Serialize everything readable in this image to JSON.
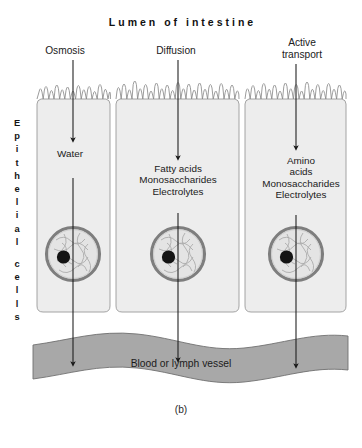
{
  "figure": {
    "title": "Lumen of intestine",
    "caption": "(b)",
    "side_label": "Epithelial cells",
    "side_label_lines": [
      "E",
      "p",
      "i",
      "t",
      "h",
      "e",
      "l",
      "i",
      "a",
      "l",
      "",
      "c",
      "e",
      "l",
      "l",
      "s"
    ],
    "vessel_label": "Blood or lymph vessel"
  },
  "transport_columns": [
    {
      "process": "Osmosis",
      "substances": "Water",
      "arrow": "down-arrow-icon"
    },
    {
      "process": "Diffusion",
      "substances": "Fatty acids\nMonosaccharides\nElectrolytes",
      "arrow": "down-arrow-icon"
    },
    {
      "process": "Active\ntransport",
      "substances": "Amino\nacids\nMonosaccharides\nElectrolytes",
      "arrow": "down-arrow-icon"
    }
  ],
  "cells": [
    {
      "name": "epithelial-cell-left",
      "nucleus": "nucleus-icon"
    },
    {
      "name": "epithelial-cell-middle",
      "nucleus": "nucleus-icon"
    },
    {
      "name": "epithelial-cell-right",
      "nucleus": "nucleus-icon"
    }
  ],
  "colors": {
    "background": "#ffffff",
    "cell_fill": "#ededed",
    "cell_outline": "#8d8d8d",
    "vessel_fill": "#a8a8a8",
    "vessel_outline": "#6e6e6e",
    "nucleus_ring": "#7e7e7e",
    "nucleus_fill": "#e4e4e4",
    "nucleolus": "#141414",
    "arrow": "#1a1a1a",
    "text": "#1f1f1f"
  }
}
